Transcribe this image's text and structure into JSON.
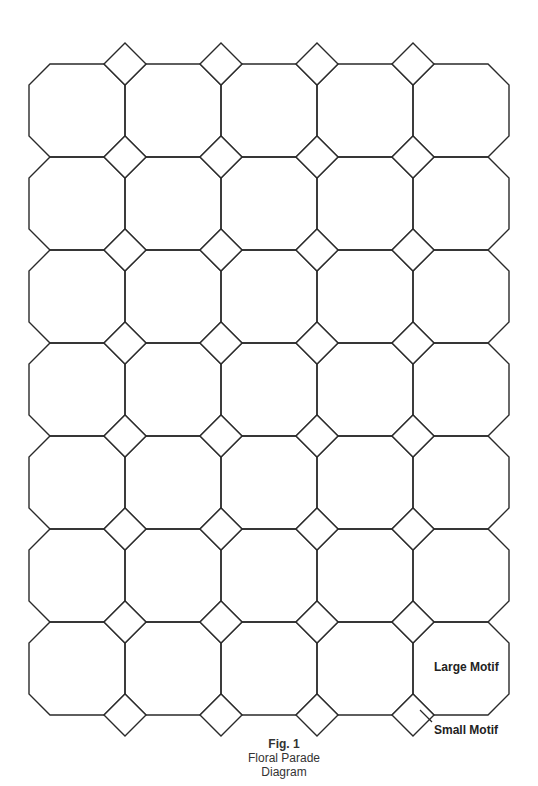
{
  "figure": {
    "number_label": "Fig. 1",
    "title_line1": "Floral Parade",
    "title_line2": "Diagram"
  },
  "labels": {
    "large_motif": "Large Motif",
    "small_motif": "Small Motif"
  },
  "grid": {
    "columns": 5,
    "rows": 7,
    "x_bounds": [
      29,
      125,
      221,
      317,
      413,
      509
    ],
    "y_bounds": [
      64,
      157,
      250,
      343,
      436,
      529,
      622,
      715
    ],
    "chamfer": 21,
    "diamond_half": 21,
    "stroke_color": "#2a2a2a",
    "stroke_width": 1.4
  },
  "motifs": {
    "large": {
      "shape": "octagon",
      "count": 35
    },
    "small": {
      "shape": "diamond",
      "count": 32
    }
  },
  "pointer": {
    "from": [
      432,
      722
    ],
    "to": [
      420,
      710
    ]
  }
}
